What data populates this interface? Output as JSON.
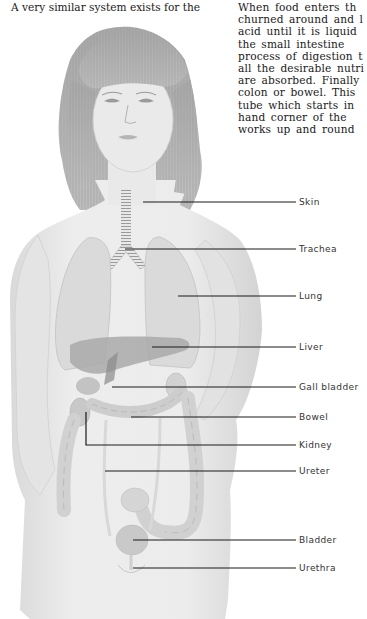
{
  "page": {
    "left_column_text": [
      "A very similar system exists for the"
    ],
    "right_column_text": [
      "When food enters th",
      "churned around and l",
      "acid until it is liquid",
      "the small intestine",
      "process of digestion t",
      "all the desirable nutri",
      "are absorbed. Finally",
      "colon or bowel. This",
      "tube which starts in",
      "hand corner of the",
      "works up and round"
    ]
  },
  "figure": {
    "labels": [
      {
        "id": "skin",
        "text": "Skin"
      },
      {
        "id": "trachea",
        "text": "Trachea"
      },
      {
        "id": "lung",
        "text": "Lung"
      },
      {
        "id": "liver",
        "text": "Liver"
      },
      {
        "id": "gall-bladder",
        "text": "Gall bladder"
      },
      {
        "id": "bowel",
        "text": "Bowel"
      },
      {
        "id": "kidney",
        "text": "Kidney"
      },
      {
        "id": "ureter",
        "text": "Ureter"
      },
      {
        "id": "bladder",
        "text": "Bladder"
      },
      {
        "id": "urethra",
        "text": "Urethra"
      }
    ]
  }
}
